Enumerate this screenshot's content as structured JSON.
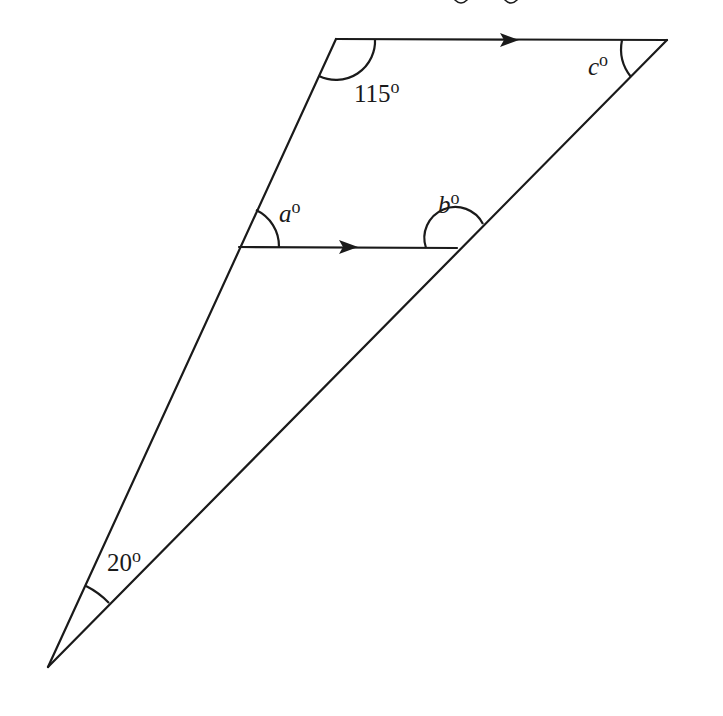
{
  "figure": {
    "type": "geometry-diagram",
    "cropped_header_text": "…g g…",
    "vertices": {
      "top_left": [
        336,
        39
      ],
      "top_right": [
        667,
        40
      ],
      "mid_left": [
        239,
        247
      ],
      "mid_right": [
        457,
        248
      ],
      "bottom": [
        48,
        667
      ]
    },
    "parallel_segments": [
      "top_left-top_right",
      "mid_left-mid_right"
    ],
    "angles": {
      "top_left": {
        "value": "115",
        "unit": "o"
      },
      "top_right": {
        "var": "c",
        "unit": "o"
      },
      "mid_left": {
        "var": "a",
        "unit": "o"
      },
      "mid_right": {
        "var": "b",
        "unit": "o"
      },
      "bottom": {
        "value": "20",
        "unit": "o"
      }
    }
  }
}
